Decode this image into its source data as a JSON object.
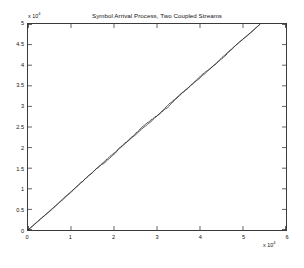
{
  "figure": {
    "title": "Symbol Arrival Process, Two Coupled Streams",
    "background": "#ffffff",
    "axis_color": "#3a3a3a",
    "line_color": "#1c1c1c"
  },
  "axes": {
    "y_multiplier_prefix": "x 10",
    "y_multiplier_exponent": "4",
    "x_multiplier_prefix": "x 10",
    "x_multiplier_exponent": "4",
    "y_ticks": [
      "0",
      "0.5",
      "1",
      "1.5",
      "2",
      "2.5",
      "3",
      "3.5",
      "4",
      "4.5",
      "5"
    ],
    "x_ticks": [
      "0",
      "1",
      "2",
      "3",
      "4",
      "5",
      "6"
    ]
  },
  "chart_data": {
    "type": "line",
    "title": "Symbol Arrival Process, Two Coupled Streams",
    "xlabel": "",
    "ylabel": "",
    "xlim": [
      0,
      60000
    ],
    "ylim": [
      0,
      50000
    ],
    "x_tick_values": [
      0,
      10000,
      20000,
      30000,
      40000,
      50000,
      60000
    ],
    "y_tick_values": [
      0,
      5000,
      10000,
      15000,
      20000,
      25000,
      30000,
      35000,
      40000,
      45000,
      50000
    ],
    "x_tick_labels": [
      "0",
      "1",
      "2",
      "3",
      "4",
      "5",
      "6"
    ],
    "y_tick_labels": [
      "0",
      "0.5",
      "1",
      "1.5",
      "2",
      "2.5",
      "3",
      "3.5",
      "4",
      "4.5",
      "5"
    ],
    "x_axis_multiplier": 10000,
    "y_axis_multiplier": 10000,
    "grid": false,
    "legend": null,
    "series": [
      {
        "name": "Stream 1",
        "color": "#1c1c1c",
        "x": [
          0,
          2700,
          5400,
          8100,
          10800,
          13500,
          16200,
          18900,
          21600,
          24300,
          27000,
          29700,
          32400,
          35100,
          37800,
          40500,
          43200,
          45900,
          48600,
          51300,
          54000
        ],
        "y": [
          0,
          2400,
          4950,
          7400,
          10050,
          12700,
          15050,
          17500,
          20100,
          22700,
          25050,
          27400,
          29950,
          32500,
          35100,
          37450,
          39950,
          42550,
          45050,
          47500,
          50000
        ]
      },
      {
        "name": "Stream 2",
        "color": "#1c1c1c",
        "x": [
          0,
          2700,
          5400,
          8100,
          10800,
          13500,
          16200,
          18900,
          21600,
          24300,
          27000,
          29700,
          32400,
          35100,
          37800,
          40500,
          43200,
          45900,
          48600,
          51300,
          54000
        ],
        "y": [
          0,
          2550,
          4850,
          7550,
          9950,
          12500,
          15200,
          17400,
          20250,
          22550,
          25200,
          27550,
          29800,
          32650,
          34950,
          37600,
          39850,
          42400,
          45200,
          47400,
          50000
        ]
      }
    ]
  }
}
